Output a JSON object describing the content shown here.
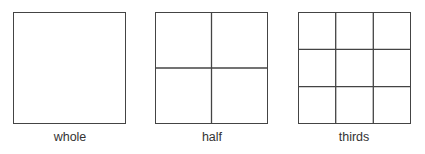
{
  "figures": [
    {
      "label": "whole",
      "divisions": 1
    },
    {
      "label": "half",
      "divisions": 2
    },
    {
      "label": "thirds",
      "divisions": 3
    }
  ],
  "colors": {
    "stroke": "#444444",
    "text": "#333333",
    "background": "#ffffff"
  }
}
